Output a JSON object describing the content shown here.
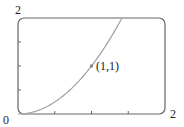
{
  "chart_data": {
    "type": "line",
    "title": "",
    "xlabel": "",
    "ylabel": "",
    "xlim": [
      0,
      2
    ],
    "ylim": [
      0,
      2
    ],
    "grid": false,
    "tick_labels": {
      "origin": "0",
      "x_max": "2",
      "y_max": "2"
    },
    "x_ticks": [
      0.5,
      1,
      1.5
    ],
    "y_ticks": [
      0.5,
      1,
      1.5
    ],
    "series": [
      {
        "name": "y = x^2",
        "color": "#999999",
        "x": [
          0,
          0.25,
          0.5,
          0.75,
          1,
          1.25,
          1.414
        ],
        "y": [
          0,
          0.0625,
          0.25,
          0.5625,
          1,
          1.5625,
          2
        ]
      }
    ],
    "annotations": [
      {
        "x": 1,
        "y": 1,
        "text": "(1,1)"
      }
    ]
  }
}
